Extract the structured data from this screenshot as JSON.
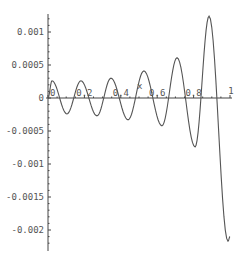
{
  "chart_data": {
    "type": "line",
    "title": "",
    "xlabel": "x",
    "ylabel": "",
    "xlim": [
      0,
      1
    ],
    "ylim": [
      -0.00225,
      0.00128
    ],
    "grid": false,
    "legend": null,
    "x_ticks": [
      {
        "value": 0,
        "label": "0"
      },
      {
        "value": 0.2,
        "label": "0.2"
      },
      {
        "value": 0.4,
        "label": "0.4"
      },
      {
        "value": 0.6,
        "label": "0.6"
      },
      {
        "value": 0.8,
        "label": "0.8"
      },
      {
        "value": 1,
        "label": "1"
      }
    ],
    "y_ticks": [
      {
        "value": 0.001,
        "label": "0.001"
      },
      {
        "value": 0.0005,
        "label": "0.0005"
      },
      {
        "value": 0,
        "label": "0"
      },
      {
        "value": -0.0005,
        "label": "-0.0005"
      },
      {
        "value": -0.001,
        "label": "-0.001"
      },
      {
        "value": -0.0015,
        "label": "-0.0015"
      },
      {
        "value": -0.002,
        "label": "-0.002"
      }
    ],
    "series": [
      {
        "name": "f(x)",
        "description": "oscillating curve with growing amplitude, extrema listed",
        "x": [
          0.0,
          0.022,
          0.104,
          0.181,
          0.269,
          0.346,
          0.44,
          0.527,
          0.626,
          0.709,
          0.808,
          0.885,
          0.989,
          1.0
        ],
        "y": [
          0.0,
          0.00026,
          -0.00024,
          0.00026,
          -0.00027,
          0.0003,
          -0.00033,
          0.00041,
          -0.00042,
          0.00061,
          -0.00074,
          0.00124,
          -0.00217,
          -0.0021
        ]
      }
    ]
  }
}
